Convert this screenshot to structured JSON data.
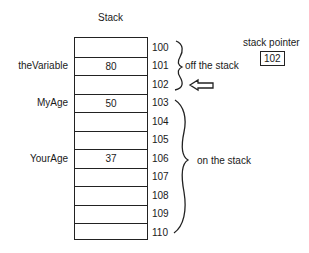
{
  "diagram": {
    "title": "Stack",
    "cells": [
      {
        "address": "100",
        "value": "",
        "label": ""
      },
      {
        "address": "101",
        "value": "80",
        "label": "theVariable"
      },
      {
        "address": "102",
        "value": "",
        "label": ""
      },
      {
        "address": "103",
        "value": "50",
        "label": "MyAge"
      },
      {
        "address": "104",
        "value": "",
        "label": ""
      },
      {
        "address": "105",
        "value": "",
        "label": ""
      },
      {
        "address": "106",
        "value": "37",
        "label": "YourAge"
      },
      {
        "address": "107",
        "value": "",
        "label": ""
      },
      {
        "address": "108",
        "value": "",
        "label": ""
      },
      {
        "address": "109",
        "value": "",
        "label": ""
      },
      {
        "address": "110",
        "value": "",
        "label": ""
      }
    ],
    "brace_off": "off the stack",
    "brace_on": "on the stack",
    "stack_pointer_label": "stack pointer",
    "stack_pointer_value": "102",
    "pointer_arrow_icon": "left-arrow-icon"
  }
}
